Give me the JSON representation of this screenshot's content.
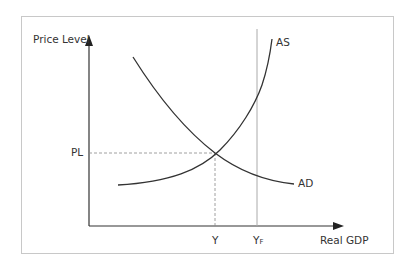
{
  "diagram": {
    "type": "AD-AS model",
    "y_axis_label": "Price Level",
    "x_axis_label": "Real GDP",
    "curves": [
      {
        "name": "AS",
        "label": "AS",
        "shape": "upward-sloping, increasingly steep"
      },
      {
        "name": "AD",
        "label": "AD",
        "shape": "downward-sloping, convex"
      }
    ],
    "equilibrium": {
      "price_label": "PL",
      "output_label": "Y"
    },
    "full_employment": {
      "label_main": "Y",
      "label_sub": "F"
    },
    "colors": {
      "curve": "#333333",
      "axis": "#333333",
      "guide": "#999999",
      "frame": "#c8c8c8"
    }
  }
}
